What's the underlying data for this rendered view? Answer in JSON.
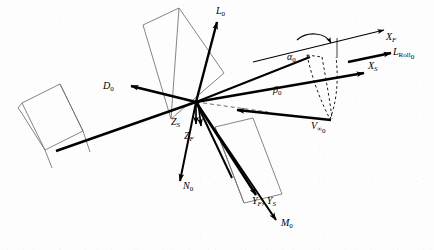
{
  "figure": {
    "type": "vector-diagram",
    "background_color": "#fdfdfd",
    "line_color": "#000000",
    "outline_color": "#6b6b6b"
  },
  "labels": {
    "lift": "L",
    "lift_sub": "0",
    "drag": "D",
    "drag_sub": "0",
    "normal": "N",
    "normal_sub": "0",
    "side": "M",
    "side_sub": "0",
    "roll": "L",
    "roll_sub": "Roll",
    "roll_sub2": "0",
    "x_f": "X",
    "x_f_sub": "F",
    "x_s": "X",
    "x_s_sub": "S",
    "z_s": "Z",
    "z_s_sub": "S",
    "z_f": "Z",
    "z_f_sub": "F",
    "y_fs": "Y",
    "y_fs_sub1": "F",
    "y_fs_comma": ", ",
    "y_fs2": "Y",
    "y_fs_sub2": "S",
    "alpha": "α",
    "alpha_sub": "0",
    "beta": "β",
    "beta_sub": "0",
    "velocity": "V",
    "velocity_sub": "∞",
    "velocity_sub2": "0"
  },
  "vectors": [
    {
      "name": "lift-vector",
      "label": "L₀",
      "from": [
        195,
        102
      ],
      "to": [
        218,
        18
      ],
      "style": "solid-bold"
    },
    {
      "name": "drag-vector",
      "label": "D₀",
      "from": [
        195,
        102
      ],
      "to": [
        124,
        85
      ],
      "style": "solid-bold"
    },
    {
      "name": "normal-vector",
      "label": "N₀",
      "from": [
        195,
        102
      ],
      "to": [
        180,
        185
      ],
      "style": "solid-bold"
    },
    {
      "name": "moment-vector",
      "label": "M₀",
      "from": [
        195,
        102
      ],
      "to": [
        277,
        224
      ],
      "style": "solid-bold"
    },
    {
      "name": "zs-axis-vector",
      "label": "Zₛ",
      "from": [
        195,
        102
      ],
      "to": [
        194,
        131
      ],
      "style": "solid-bold"
    },
    {
      "name": "zf-axis-vector",
      "label": "Z_F",
      "from": [
        195,
        102
      ],
      "to": [
        199,
        133
      ],
      "style": "solid-bold"
    },
    {
      "name": "xs-axis-vector",
      "label": "X_S",
      "from": [
        195,
        102
      ],
      "to": [
        371,
        72
      ],
      "style": "solid-bold"
    },
    {
      "name": "xf-axis-vector",
      "label": "X_F",
      "from": [
        250,
        62
      ],
      "to": [
        388,
        30
      ],
      "style": "solid-thin"
    },
    {
      "name": "roll-moment-vector",
      "label": "L_Roll₀",
      "from": [
        347,
        62
      ],
      "to": [
        398,
        52
      ],
      "style": "solid-bold"
    },
    {
      "name": "velocity-vector",
      "label": "V_∞₀",
      "from": [
        330,
        120
      ],
      "to": [
        230,
        110
      ],
      "style": "solid-bold"
    },
    {
      "name": "yfs-axis-vector",
      "label": "Y_F , Y_S",
      "from": [
        195,
        102
      ],
      "to": [
        257,
        198
      ],
      "style": "solid-bold"
    }
  ],
  "angles": [
    {
      "name": "alpha-angle",
      "label": "α₀",
      "position": [
        292,
        58
      ],
      "between": [
        "X_S",
        "X_F"
      ]
    },
    {
      "name": "beta-angle",
      "label": "β₀",
      "position": [
        278,
        88
      ],
      "between": [
        "X_S",
        "V_∞₀"
      ]
    }
  ],
  "wing_panels": [
    {
      "name": "left-wing-panel",
      "points": "22,102 58,85 80,130 44,148"
    },
    {
      "name": "upper-wing-panel",
      "points": "143,24 178,8 222,72 170,118"
    },
    {
      "name": "lower-wing-panel",
      "points": "214,126 252,118 281,193 243,202"
    }
  ]
}
